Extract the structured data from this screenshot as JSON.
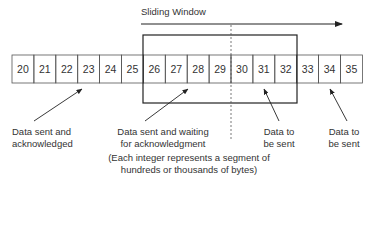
{
  "diagram": {
    "title": "Sliding Window",
    "segments": [
      "20",
      "21",
      "22",
      "23",
      "24",
      "25",
      "26",
      "27",
      "28",
      "29",
      "30",
      "31",
      "32",
      "33",
      "34",
      "35"
    ],
    "window": {
      "start_index": 6,
      "end_index": 12,
      "divider_after": "29"
    },
    "labels": {
      "acked_line1": "Data sent and",
      "acked_line2": "acknowledged",
      "waiting_line1": "Data sent and waiting",
      "waiting_line2": "for acknowledgment",
      "tosend1_line1": "Data to",
      "tosend1_line2": "be sent",
      "tosend2_line1": "Data to",
      "tosend2_line2": "be sent",
      "note_line1": "(Each integer represents a segment of",
      "note_line2": "hundreds or thousands of bytes)"
    }
  }
}
